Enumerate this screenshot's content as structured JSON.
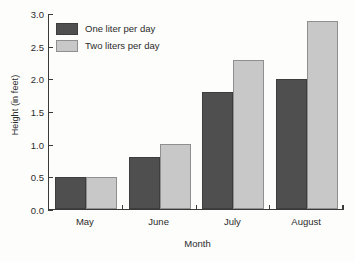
{
  "chart_data": {
    "type": "bar",
    "title": "",
    "xlabel": "Month",
    "ylabel": "Height (in feet)",
    "categories": [
      "May",
      "June",
      "July",
      "August"
    ],
    "series": [
      {
        "name": "One liter per day",
        "color": "#4f4f4f",
        "values": [
          0.5,
          0.8,
          1.8,
          2.0
        ]
      },
      {
        "name": "Two liters per day",
        "color": "#c8c8c8",
        "values": [
          0.5,
          1.0,
          2.3,
          2.9
        ]
      }
    ],
    "ylim": [
      0.0,
      3.0
    ],
    "ytick_labels": [
      "0.0",
      "0.5",
      "1.0",
      "1.5",
      "2.0",
      "2.5",
      "3.0"
    ],
    "ytick_values": [
      0.0,
      0.5,
      1.0,
      1.5,
      2.0,
      2.5,
      3.0
    ],
    "grid": false,
    "legend_position": "top-left"
  }
}
